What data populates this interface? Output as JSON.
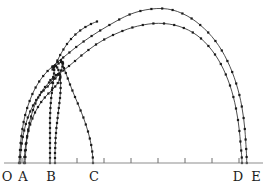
{
  "figure": {
    "background_color": "#ffffff",
    "curve_color": "#3a3a3a",
    "marker_color": "#1a1a1a",
    "axis_color": "#8d8d8d",
    "label_color": "#1c1c1c"
  },
  "axis": {
    "name": "horizontal-baseline",
    "y": 163,
    "x_start": 4,
    "x_end": 263,
    "tick_length": 5,
    "ticks": [
      {
        "label": "",
        "x": 22
      },
      {
        "label": "",
        "x": 50
      },
      {
        "label": "",
        "x": 77
      },
      {
        "label": "",
        "x": 104
      },
      {
        "label": "",
        "x": 131
      },
      {
        "label": "",
        "x": 158
      },
      {
        "label": "",
        "x": 185
      },
      {
        "label": "",
        "x": 212
      },
      {
        "label": "",
        "x": 239
      }
    ],
    "labels": [
      {
        "text": "O",
        "x": 7,
        "y": 181
      },
      {
        "text": "A",
        "x": 23,
        "y": 181
      },
      {
        "text": "B",
        "x": 51,
        "y": 181
      },
      {
        "text": "C",
        "x": 94,
        "y": 181
      },
      {
        "text": "D",
        "x": 238,
        "y": 181
      },
      {
        "text": "E",
        "x": 256,
        "y": 181
      }
    ]
  },
  "chart_data": {
    "type": "line",
    "title": "",
    "subtitle": "",
    "xlabel": "",
    "ylabel": "",
    "xlim": [
      0,
      266
    ],
    "ylim": [
      186,
      0
    ],
    "grid": false,
    "legend": "none",
    "marker": "square",
    "marker_size": 2.2,
    "annotations": [
      "O",
      "A",
      "B",
      "C",
      "D",
      "E"
    ],
    "series": [
      {
        "name": "outer-arc-upper",
        "points": [
          [
            19,
            163
          ],
          [
            19.5,
            157
          ],
          [
            20,
            150
          ],
          [
            20.6,
            143
          ],
          [
            21.4,
            136
          ],
          [
            22.4,
            129
          ],
          [
            23.6,
            122
          ],
          [
            25.2,
            115
          ],
          [
            27.2,
            108
          ],
          [
            29.6,
            101
          ],
          [
            32.4,
            94
          ],
          [
            35.6,
            87.5
          ],
          [
            39.2,
            81.5
          ],
          [
            43.2,
            76
          ],
          [
            47.6,
            71
          ],
          [
            52.4,
            66.5
          ],
          [
            57.6,
            62
          ],
          [
            63.2,
            57.5
          ],
          [
            69.4,
            52.5
          ],
          [
            76.2,
            47
          ],
          [
            83.6,
            41.5
          ],
          [
            91.6,
            36
          ],
          [
            100.2,
            30.5
          ],
          [
            109.4,
            25
          ],
          [
            119.2,
            19.5
          ],
          [
            129.6,
            14.5
          ],
          [
            140.4,
            11
          ],
          [
            151.4,
            9
          ],
          [
            162.2,
            8.5
          ],
          [
            172.6,
            10
          ],
          [
            182.4,
            13.5
          ],
          [
            191.6,
            18.5
          ],
          [
            200.2,
            25
          ],
          [
            208.2,
            32.5
          ],
          [
            215.4,
            41
          ],
          [
            221.8,
            50.5
          ],
          [
            227.4,
            61
          ],
          [
            232.2,
            72
          ],
          [
            236.2,
            83.5
          ],
          [
            239.4,
            95
          ],
          [
            241.8,
            106.5
          ],
          [
            243.6,
            118
          ],
          [
            244.8,
            129
          ],
          [
            245.6,
            139.5
          ],
          [
            246.2,
            149
          ],
          [
            246.6,
            157
          ],
          [
            246.8,
            163
          ]
        ]
      },
      {
        "name": "outer-arc-lower",
        "points": [
          [
            25,
            163
          ],
          [
            25.4,
            157
          ],
          [
            25.8,
            150
          ],
          [
            26.4,
            143
          ],
          [
            27.2,
            136
          ],
          [
            28.2,
            129.5
          ],
          [
            29.4,
            123
          ],
          [
            31,
            116.5
          ],
          [
            33,
            110
          ],
          [
            35.4,
            103.5
          ],
          [
            38.2,
            97.5
          ],
          [
            41.4,
            92
          ],
          [
            45,
            87
          ],
          [
            49,
            82.5
          ],
          [
            53.4,
            78.5
          ],
          [
            58.2,
            74.5
          ],
          [
            63.4,
            70.5
          ],
          [
            69,
            66
          ],
          [
            75,
            61
          ],
          [
            81.4,
            55.5
          ],
          [
            88.4,
            50
          ],
          [
            96,
            44.5
          ],
          [
            104.2,
            39.5
          ],
          [
            113,
            35
          ],
          [
            122.4,
            31
          ],
          [
            132.4,
            27.5
          ],
          [
            142.8,
            25
          ],
          [
            153.4,
            23.5
          ],
          [
            164,
            23.5
          ],
          [
            174.2,
            25
          ],
          [
            183.8,
            28
          ],
          [
            192.8,
            32.5
          ],
          [
            201,
            38.5
          ],
          [
            208.4,
            46
          ],
          [
            215,
            54.5
          ],
          [
            220.8,
            64
          ],
          [
            225.8,
            74.5
          ],
          [
            230,
            85.5
          ],
          [
            233.4,
            97
          ],
          [
            236,
            108.5
          ],
          [
            238,
            120
          ],
          [
            239.4,
            131
          ],
          [
            240.4,
            141.5
          ],
          [
            241.2,
            150.5
          ],
          [
            241.8,
            157.5
          ],
          [
            242,
            163
          ]
        ]
      },
      {
        "name": "inner-ridge-upper",
        "points": [
          [
            20,
            163
          ],
          [
            20.4,
            157
          ],
          [
            21,
            150
          ],
          [
            21.8,
            143.5
          ],
          [
            22.8,
            137
          ],
          [
            24.2,
            130.5
          ],
          [
            25.8,
            124
          ],
          [
            27.8,
            117.5
          ],
          [
            30.2,
            111.5
          ],
          [
            33,
            105.5
          ],
          [
            36.2,
            100
          ],
          [
            39.8,
            95
          ],
          [
            43.6,
            90.5
          ],
          [
            47.6,
            86.5
          ],
          [
            51.6,
            82.5
          ],
          [
            55.4,
            78.5
          ],
          [
            58.6,
            74.5
          ],
          [
            61,
            70.5
          ],
          [
            62.4,
            66.5
          ],
          [
            63,
            63.5
          ],
          [
            62.6,
            62
          ],
          [
            61,
            62
          ],
          [
            58.6,
            63.5
          ],
          [
            55.6,
            66
          ],
          [
            52.6,
            69.5
          ]
        ]
      },
      {
        "name": "inner-ridge-lower",
        "points": [
          [
            24,
            163
          ],
          [
            24.4,
            157
          ],
          [
            25,
            150.5
          ],
          [
            25.8,
            144
          ],
          [
            27,
            137.5
          ],
          [
            28.4,
            131
          ],
          [
            30.2,
            124.5
          ],
          [
            32.4,
            118.5
          ],
          [
            35,
            112.5
          ],
          [
            38,
            107
          ],
          [
            41.2,
            102
          ],
          [
            44.8,
            97.5
          ],
          [
            48.4,
            93.5
          ],
          [
            52,
            90
          ],
          [
            55.2,
            86.5
          ],
          [
            57.8,
            83
          ],
          [
            59.6,
            79.5
          ],
          [
            60.4,
            76.5
          ],
          [
            60,
            74.5
          ],
          [
            58.4,
            74
          ],
          [
            56,
            75
          ],
          [
            53.2,
            77
          ],
          [
            50.4,
            80
          ]
        ]
      },
      {
        "name": "vertical-column-b-left",
        "points": [
          [
            50,
            163
          ],
          [
            50,
            158
          ],
          [
            50,
            153
          ],
          [
            50,
            148
          ],
          [
            50,
            143
          ],
          [
            50,
            138
          ],
          [
            50,
            133
          ],
          [
            50,
            128
          ],
          [
            50,
            123
          ],
          [
            50,
            118
          ],
          [
            50.2,
            113
          ],
          [
            50.4,
            108
          ],
          [
            50.8,
            103
          ],
          [
            51.2,
            98
          ],
          [
            51.8,
            93
          ],
          [
            52.4,
            88
          ],
          [
            53,
            83
          ],
          [
            53.6,
            78
          ],
          [
            54,
            73.5
          ],
          [
            54.2,
            70
          ],
          [
            54,
            67.5
          ],
          [
            53.4,
            66.5
          ],
          [
            52.6,
            67.5
          ]
        ]
      },
      {
        "name": "vertical-column-b-right",
        "points": [
          [
            55,
            163
          ],
          [
            55,
            158
          ],
          [
            55,
            153
          ],
          [
            55.2,
            148
          ],
          [
            55.4,
            143
          ],
          [
            55.6,
            138
          ],
          [
            56,
            133
          ],
          [
            56.4,
            128
          ],
          [
            57,
            123
          ],
          [
            57.6,
            118
          ],
          [
            58.2,
            113
          ],
          [
            58.8,
            108
          ],
          [
            59.4,
            103
          ],
          [
            60,
            98
          ],
          [
            60.4,
            93
          ],
          [
            60.6,
            88
          ],
          [
            60.6,
            83
          ],
          [
            60.2,
            78
          ],
          [
            59.4,
            73.5
          ],
          [
            58.4,
            70
          ],
          [
            57.2,
            67.5
          ],
          [
            56,
            66
          ],
          [
            55,
            65.5
          ]
        ]
      },
      {
        "name": "descending-branch-to-c",
        "points": [
          [
            61,
            60
          ],
          [
            62.4,
            63.5
          ],
          [
            64,
            68
          ],
          [
            65.8,
            73
          ],
          [
            67.8,
            78.5
          ],
          [
            70,
            84.5
          ],
          [
            72.4,
            90.5
          ],
          [
            75,
            97
          ],
          [
            77.8,
            103.5
          ],
          [
            80.6,
            110.5
          ],
          [
            83.4,
            117.5
          ],
          [
            85.8,
            124.5
          ],
          [
            88,
            131.5
          ],
          [
            89.8,
            138.5
          ],
          [
            91.2,
            145
          ],
          [
            92.2,
            151.5
          ],
          [
            92.8,
            157.5
          ],
          [
            93,
            163
          ]
        ]
      },
      {
        "name": "rising-branch-from-b-peak",
        "points": [
          [
            55,
            66
          ],
          [
            57.4,
            60.5
          ],
          [
            60.2,
            55
          ],
          [
            63.4,
            49.5
          ],
          [
            67,
            44
          ],
          [
            71,
            39
          ],
          [
            75.4,
            34.5
          ],
          [
            80.2,
            30.5
          ],
          [
            85.4,
            27
          ],
          [
            91,
            24
          ],
          [
            97,
            21.5
          ]
        ]
      }
    ]
  }
}
